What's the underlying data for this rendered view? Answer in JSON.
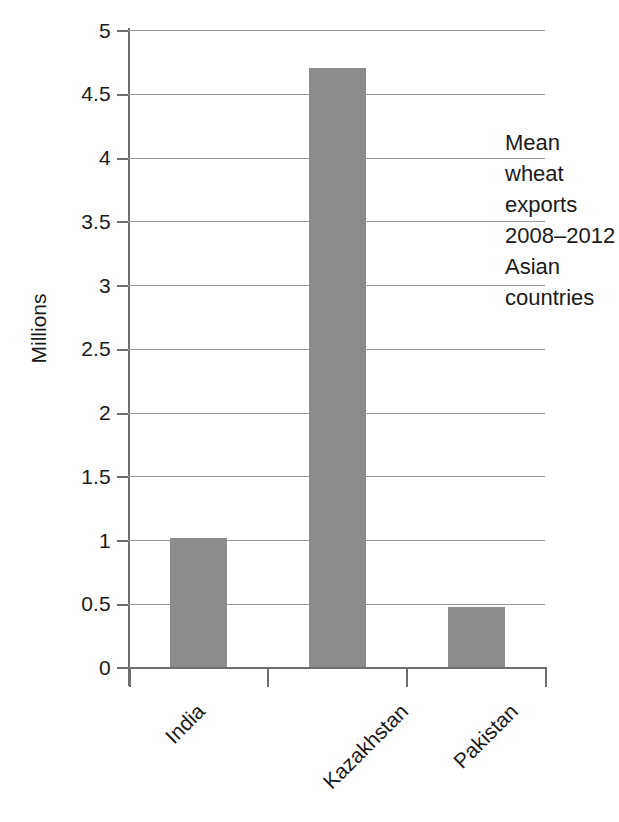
{
  "chart_data": {
    "type": "bar",
    "title": "",
    "subtitle": "",
    "categories": [
      "India",
      "Kazakhstan",
      "Pakistan"
    ],
    "values": [
      1.02,
      4.7,
      0.48
    ],
    "series": [
      {
        "name": "Mean wheat exports 2008-2012",
        "values": [
          1.02,
          4.7,
          0.48
        ]
      }
    ],
    "xlabel": "",
    "ylabel": "Millions",
    "ylim": [
      0,
      5
    ],
    "ytick_labels": [
      "0",
      "0.5",
      "1",
      "1.5",
      "2",
      "2.5",
      "3",
      "3.5",
      "4",
      "4.5",
      "5"
    ],
    "ytick_values": [
      0,
      0.5,
      1,
      1.5,
      2,
      2.5,
      3,
      3.5,
      4,
      4.5,
      5
    ],
    "grid": "horizontal",
    "legend": "none",
    "bar_color": "#8c8c8c",
    "gridline_color": "#9a9a9a",
    "axis_color": "#6e6e6e",
    "annotations": [
      {
        "text": "Mean\nwheat\nexports\n2008–2012\nAsian\ncountries",
        "lines": [
          "Mean",
          "wheat",
          "exports",
          "2008–2012",
          "Asian",
          "countries"
        ]
      }
    ]
  }
}
